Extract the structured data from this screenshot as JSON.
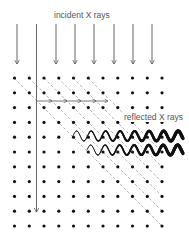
{
  "labels": {
    "incident": "incident X rays",
    "reflected": "reflected X rays"
  },
  "colors": {
    "dot": "#111111",
    "arrow": "#555555",
    "dash": "#888888",
    "wave": "#111111",
    "text": "#555555"
  },
  "lattice": {
    "x0": 14.5,
    "y0": 78,
    "dx": 14.75,
    "dy": 14.8,
    "cols": 11,
    "rows": 11,
    "radius": 1.6
  },
  "incident_arrows": {
    "xs": [
      17,
      56,
      75,
      94,
      114,
      133,
      152
    ],
    "y_start": 24,
    "y_end": 64
  },
  "long_arrow": {
    "x": 36.5,
    "y_start": 24,
    "y_end": 212
  },
  "horizontal_arrows": {
    "y": 101,
    "xs": [
      37,
      52,
      67,
      81,
      96,
      108
    ]
  },
  "diagonals": [
    {
      "x1": 14,
      "y1": 78,
      "x2": 162,
      "y2": 226
    },
    {
      "x1": 29,
      "y1": 78,
      "x2": 162,
      "y2": 211
    },
    {
      "x1": 44,
      "y1": 78,
      "x2": 162,
      "y2": 196
    },
    {
      "x1": 58,
      "y1": 78,
      "x2": 162,
      "y2": 182
    },
    {
      "x1": 73,
      "y1": 78,
      "x2": 162,
      "y2": 167
    },
    {
      "x1": 88,
      "y1": 78,
      "x2": 162,
      "y2": 152
    }
  ],
  "waves": [
    {
      "x_start": 73,
      "x_end": 183,
      "y": 136,
      "amp": 5,
      "period": 14.5,
      "w_start": 0.6,
      "w_end": 3.4
    },
    {
      "x_start": 87,
      "x_end": 183,
      "y": 150,
      "amp": 5,
      "period": 14.5,
      "w_start": 0.6,
      "w_end": 3.4
    }
  ]
}
